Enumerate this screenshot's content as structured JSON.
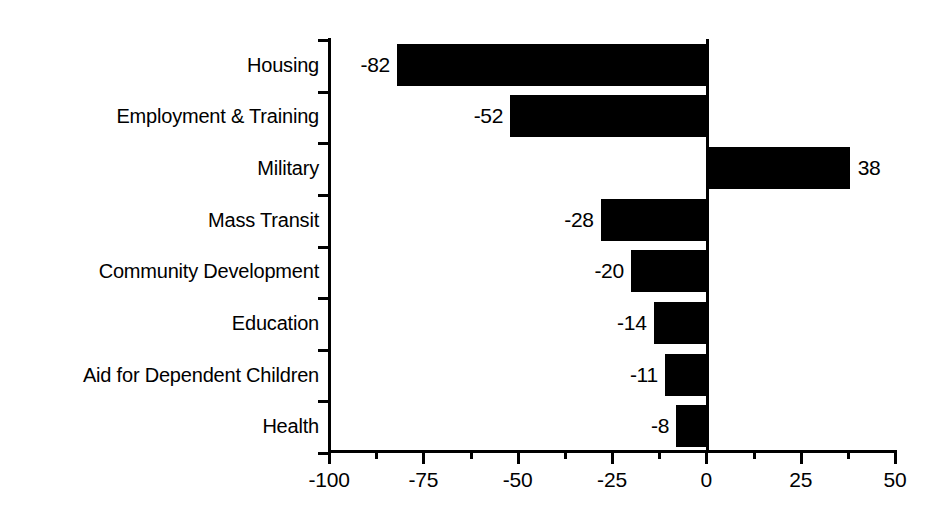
{
  "chart_data": {
    "type": "bar",
    "orientation": "horizontal",
    "title": "",
    "subtitle": "",
    "xlabel": "",
    "ylabel": "",
    "categories": [
      "Housing",
      "Employment & Training",
      "Military",
      "Mass Transit",
      "Community Development",
      "Education",
      "Aid for Dependent Children",
      "Health"
    ],
    "values": [
      -82,
      -52,
      38,
      -28,
      -20,
      -14,
      -11,
      -8
    ],
    "value_labels": [
      "-82",
      "-52",
      "38",
      "-28",
      "-20",
      "-14",
      "-11",
      "-8"
    ],
    "xlim": [
      -100,
      50
    ],
    "xticks": [
      -100,
      -75,
      -50,
      -25,
      0,
      25,
      50
    ],
    "xtick_labels": [
      "-100",
      "-75",
      "-50",
      "-25",
      "0",
      "25",
      "50"
    ],
    "x_minor_ticks": [
      -87.5,
      -62.5,
      -37.5,
      -12.5,
      12.5,
      37.5
    ],
    "grid": false,
    "legend": false,
    "legend_position": "none",
    "bar_color": "#000000",
    "background_color": "#ffffff",
    "axis_color": "#000000"
  }
}
